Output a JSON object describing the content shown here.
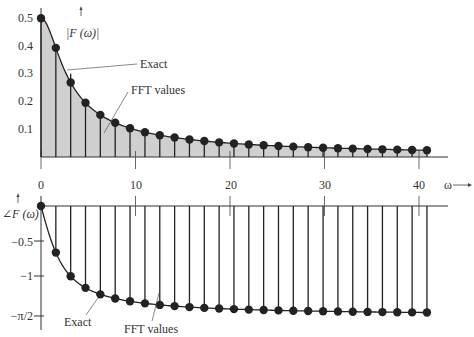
{
  "chart_data": [
    {
      "type": "line",
      "title": "",
      "ylabel": "|F (ω)|",
      "xlabel": "ω",
      "ylim": [
        0,
        0.5
      ],
      "xlim": [
        0,
        42
      ],
      "grid": false,
      "x_ticks": [
        "0",
        "10",
        "20",
        "30",
        "40"
      ],
      "y_ticks": [
        "0.1",
        "0.2",
        "0.3",
        "0.4",
        "0.5"
      ],
      "annotations": [
        "Exact",
        "FFT values"
      ],
      "series": [
        {
          "name": "Exact",
          "style": "curve",
          "formula": "1/sqrt(4+ω²)"
        },
        {
          "name": "FFT values",
          "style": "stem",
          "x": [
            0,
            1.57,
            3.14,
            4.71,
            6.28,
            7.85,
            9.42,
            11.0,
            12.57,
            14.14,
            15.71,
            17.28,
            18.85,
            20.42,
            21.99,
            23.56,
            25.13,
            26.7,
            28.27,
            29.85,
            31.42,
            32.99,
            34.56,
            36.13,
            37.7,
            39.27,
            40.84
          ],
          "values": [
            0.5,
            0.39,
            0.3,
            0.2,
            0.15,
            0.12,
            0.1,
            0.088,
            0.078,
            0.069,
            0.062,
            0.057,
            0.052,
            0.048,
            0.045,
            0.042,
            0.039,
            0.037,
            0.035,
            0.033,
            0.032,
            0.03,
            0.029,
            0.028,
            0.026,
            0.025,
            0.024
          ]
        }
      ]
    },
    {
      "type": "line",
      "title": "",
      "ylabel": "∠F (ω)",
      "xlabel": "ω",
      "ylim": [
        -1.5708,
        0
      ],
      "grid": false,
      "y_ticks": [
        "−0.5",
        "−1",
        "−π/2"
      ],
      "annotations": [
        "Exact",
        "FFT values"
      ],
      "series": [
        {
          "name": "Exact",
          "style": "curve",
          "formula": "-atan(ω/2)"
        },
        {
          "name": "FFT values",
          "style": "stem",
          "x": [
            0,
            1.57,
            3.14,
            4.71,
            6.28,
            7.85,
            9.42,
            11.0,
            12.57,
            14.14,
            15.71,
            17.28,
            18.85,
            20.42,
            21.99,
            23.56,
            25.13,
            26.7,
            28.27,
            29.85,
            31.42,
            32.99,
            34.56,
            36.13,
            37.7,
            39.27,
            40.84
          ],
          "values": [
            0,
            -0.67,
            -1.0,
            -1.17,
            -1.26,
            -1.32,
            -1.36,
            -1.39,
            -1.41,
            -1.43,
            -1.44,
            -1.46,
            -1.46,
            -1.47,
            -1.48,
            -1.49,
            -1.49,
            -1.5,
            -1.5,
            -1.5,
            -1.51,
            -1.51,
            -1.51,
            -1.52,
            -1.52,
            -1.52,
            -1.52
          ]
        }
      ]
    }
  ],
  "labels": {
    "mag_axis": "|F (ω)|",
    "phase_axis": "∠F (ω)",
    "omega": "ω",
    "exact_top": "Exact",
    "fft_top": "FFT values",
    "exact_bottom": "Exact",
    "fft_bottom": "FFT values",
    "x_ticks": [
      "0",
      "10",
      "20",
      "30",
      "40"
    ],
    "mag_ticks": [
      "0.1",
      "0.2",
      "0.3",
      "0.4",
      "0.5"
    ],
    "phase_ticks": [
      "−0.5",
      "−1",
      "−π/2"
    ]
  }
}
